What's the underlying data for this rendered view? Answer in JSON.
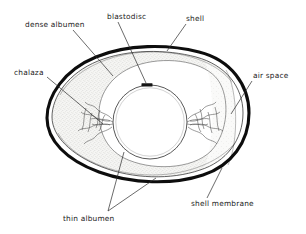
{
  "diagram": {
    "type": "labeled-biological-diagram",
    "background_color": "#ffffff",
    "line_color": "#1a1a1a",
    "shell_color": "#111111",
    "albumen_fill": "#f2f2f0",
    "yolk_fill": "#ffffff",
    "labels": [
      {
        "id": "dense-albumen",
        "text": "dense albumen",
        "x": 25,
        "y": 27,
        "anchor": "start",
        "leader": "M 73,30 L 113,76"
      },
      {
        "id": "blastodisc",
        "text": "blastodisc",
        "x": 107,
        "y": 19,
        "anchor": "start",
        "leader": "M 118,22 L 146,83"
      },
      {
        "id": "shell",
        "text": "shell",
        "x": 186,
        "y": 21,
        "anchor": "start",
        "leader": "M 186,24 L 167,51"
      },
      {
        "id": "chalaza",
        "text": "chalaza",
        "x": 14,
        "y": 75,
        "anchor": "start",
        "leader": "M 47,77 L 103,124"
      },
      {
        "id": "air-space",
        "text": "air space",
        "x": 253,
        "y": 78,
        "anchor": "start",
        "leader": "M 252,81 L 231,114"
      },
      {
        "id": "thin-albumen",
        "text": "thin albumen",
        "x": 63,
        "y": 221,
        "anchor": "start",
        "leader": "M 108,211 L 124,152 M 108,211 L 156,178"
      },
      {
        "id": "shell-membrane",
        "text": "shell membrane",
        "x": 191,
        "y": 206,
        "anchor": "start",
        "leader": "M 207,198 L 222,168"
      }
    ],
    "structures": [
      {
        "id": "shell-outline",
        "description": "thick black ovoid shell outline"
      },
      {
        "id": "shell-membrane-line",
        "description": "thin inner line following the shell"
      },
      {
        "id": "dense-albumen-region",
        "description": "stippled grey band around the yolk"
      },
      {
        "id": "thin-albumen-region",
        "description": "clear zone between yolk and dense albumen"
      },
      {
        "id": "yolk",
        "description": "large white circle at the centre"
      },
      {
        "id": "blastodisc-mark",
        "description": "small dark bar on the upper yolk surface"
      },
      {
        "id": "chalaza-left",
        "description": "twisted cord left of the yolk"
      },
      {
        "id": "chalaza-right",
        "description": "twisted cord right of the yolk"
      },
      {
        "id": "air-space-region",
        "description": "gap between shell and membrane at the blunt right end"
      }
    ]
  }
}
